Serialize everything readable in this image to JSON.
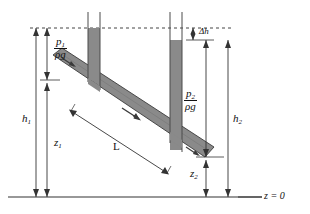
{
  "figure": {
    "type": "fluid-mechanics-schematic",
    "colors": {
      "pipe_fill": "#8a8a8a",
      "pipe_stroke": "#3a3a3a",
      "line": "#333333",
      "datum": "#333333",
      "dashed": "#444444",
      "background": "#ffffff"
    }
  },
  "labels": {
    "p1_num": "p",
    "p1_sub": "1",
    "p1_den_rho": "ρ",
    "p1_den_g": "g",
    "p2_num": "p",
    "p2_sub": "2",
    "p2_den_rho": "ρ",
    "p2_den_g": "g",
    "delta_h": "Δh",
    "h1": "h",
    "h1_sub": "1",
    "h2": "h",
    "h2_sub": "2",
    "z1": "z",
    "z1_sub": "1",
    "z2": "z",
    "z2_sub": "2",
    "length": "L",
    "datum": "z = 0"
  },
  "geometry": {
    "datum_y": 197,
    "reference_line_y": 28,
    "left_tube": {
      "x1": 88,
      "x2": 100,
      "top_y": 12,
      "fill_top_y": 28
    },
    "right_tube": {
      "x1": 170,
      "x2": 182,
      "top_y": 12,
      "fill_top_y": 40
    },
    "pipe": {
      "start_x": 55,
      "start_y": 60,
      "end_x": 205,
      "end_y": 158,
      "angle_deg": -33
    },
    "dimensions": {
      "h1_x": 36,
      "z1_x": 47,
      "p1_x": 47,
      "p2_x": 206,
      "h2_x": 228,
      "z2_x": 206,
      "delta_h_x": 193
    }
  },
  "annotations": {
    "flow_arrow": "flow-direction-arrow",
    "length_dimension": "pipe-length-dimension"
  }
}
